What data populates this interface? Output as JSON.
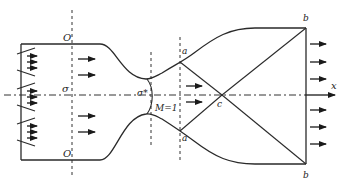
{
  "figure": {
    "labels": {
      "section_top": "O",
      "section_bottom": "O",
      "section_sigma": "σ",
      "throat_sigma": "σ*",
      "mach_line": "M=1",
      "point_a_top": "a",
      "point_a_bottom": "a",
      "point_c": "c",
      "point_b_top": "b",
      "point_b_bottom": "b",
      "axis_x": "x"
    },
    "icons": {
      "injector": "injector-icon",
      "flow_arrow": "flow-arrow-icon"
    },
    "counts": {
      "injectors": 3,
      "chamber_flow_arrows": 4,
      "diverging_flow_arrows": 2,
      "exit_flow_arrows": 6
    }
  }
}
